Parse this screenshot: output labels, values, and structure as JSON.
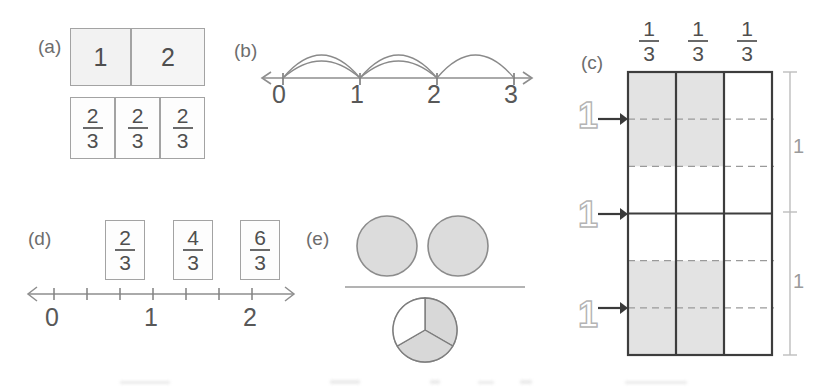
{
  "figure": {
    "title_visible": false,
    "background": "#ffffff",
    "ink_color": "#4a4a4a",
    "shade_color": "#e3e3e3"
  },
  "panels": {
    "a": {
      "label": "(a)",
      "top_row": {
        "cells": [
          "1",
          "2"
        ]
      },
      "bottom_row": {
        "cells": [
          {
            "numerator": "2",
            "denominator": "3"
          },
          {
            "numerator": "2",
            "denominator": "3"
          },
          {
            "numerator": "2",
            "denominator": "3"
          }
        ]
      }
    },
    "b": {
      "label": "(b)",
      "axis_ticks": [
        "0",
        "1",
        "2",
        "3"
      ],
      "arcs_note": "double arcs over 0-1 and 1-2, single arc over 2-3",
      "arrow_left": true,
      "arrow_right": true
    },
    "c": {
      "label": "(c)",
      "column_headers": [
        {
          "numerator": "1",
          "denominator": "3"
        },
        {
          "numerator": "1",
          "denominator": "3"
        },
        {
          "numerator": "1",
          "denominator": "3"
        }
      ],
      "row_arrow_labels": [
        "1",
        "1",
        "1"
      ],
      "right_bracket_labels": [
        "1",
        "1"
      ],
      "columns": 3,
      "unit_rows": 2,
      "bands_per_unit_row": 3
    },
    "d": {
      "label": "(d)",
      "boxed_fractions": [
        {
          "numerator": "2",
          "denominator": "3"
        },
        {
          "numerator": "4",
          "denominator": "3"
        },
        {
          "numerator": "6",
          "denominator": "3"
        }
      ],
      "axis_labels": [
        "0",
        "1",
        "2"
      ],
      "tick_count": 7,
      "arrow_left": true,
      "arrow_right": true
    },
    "e": {
      "label": "(e)",
      "top_circles": 2,
      "top_circles_fill": "full",
      "divider_line": true,
      "bottom_pie": {
        "slices": 3,
        "shaded": 2
      }
    }
  }
}
